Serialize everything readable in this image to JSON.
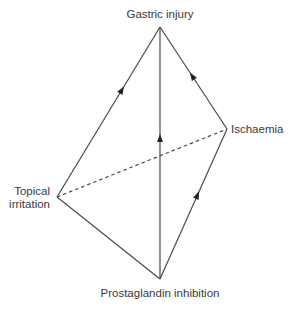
{
  "diagram": {
    "type": "causal-network",
    "nodes": [
      {
        "id": "gastric_injury",
        "label": "Gastric injury"
      },
      {
        "id": "ischaemia",
        "label": "Ischaemia"
      },
      {
        "id": "topical_irritation",
        "label_lines": [
          "Topical",
          "irritation"
        ]
      },
      {
        "id": "prostaglandin_inhibition",
        "label": "Prostaglandin inhibition"
      }
    ],
    "edges": [
      {
        "from": "topical_irritation",
        "to": "gastric_injury",
        "style": "solid",
        "arrow": true
      },
      {
        "from": "prostaglandin_inhibition",
        "to": "gastric_injury",
        "style": "solid",
        "arrow": true
      },
      {
        "from": "ischaemia",
        "to": "gastric_injury",
        "style": "solid",
        "arrow": true
      },
      {
        "from": "prostaglandin_inhibition",
        "to": "ischaemia",
        "style": "solid",
        "arrow": true
      },
      {
        "from": "topical_irritation",
        "to": "prostaglandin_inhibition",
        "style": "solid",
        "arrow": false
      },
      {
        "from": "topical_irritation",
        "to": "ischaemia",
        "style": "dashed",
        "arrow": false
      }
    ]
  }
}
